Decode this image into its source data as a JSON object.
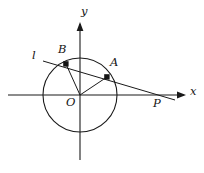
{
  "figure": {
    "background_color": "#ffffff",
    "stroke_color": "#1a1a1a",
    "width": 204,
    "height": 173
  },
  "axes": {
    "x_label": "x",
    "y_label": "y",
    "origin_label": "O",
    "x_axis": {
      "x1": 8,
      "y1": 95,
      "x2": 186,
      "y2": 95
    },
    "y_axis": {
      "x1": 80,
      "y1": 160,
      "x2": 80,
      "y2": 22
    }
  },
  "circle": {
    "center_x": 80,
    "center_y": 95,
    "radius": 37
  },
  "points": [
    {
      "name": "B",
      "label": "B",
      "x": 66,
      "y": 64,
      "label_x": 58,
      "label_y": 45
    },
    {
      "name": "A",
      "label": "A",
      "x": 107,
      "y": 77,
      "label_x": 109,
      "label_y": 58
    },
    {
      "name": "P",
      "label": "P",
      "x": 160,
      "y": 95,
      "label_x": 153,
      "label_y": 98
    },
    {
      "name": "O",
      "label": "O",
      "x": 80,
      "y": 95,
      "label_x": 66,
      "label_y": 97
    }
  ],
  "line": {
    "name": "l",
    "label": "l",
    "label_x": 32,
    "label_y": 52,
    "x1": 43,
    "y1": 61,
    "x2": 175,
    "y2": 100
  },
  "segments": [
    {
      "name": "OB",
      "x1": 80,
      "y1": 95,
      "x2": 66,
      "y2": 64
    },
    {
      "name": "OA",
      "x1": 80,
      "y1": 95,
      "x2": 107,
      "y2": 77
    }
  ]
}
